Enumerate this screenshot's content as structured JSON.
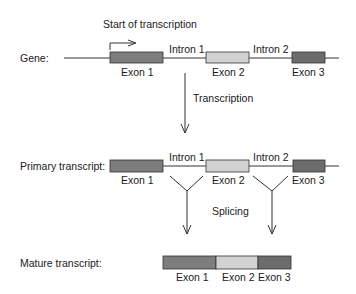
{
  "diagram": {
    "gene": {
      "row_label": "Gene:",
      "start_label": "Start of transcription",
      "exons": [
        "Exon 1",
        "Exon 2",
        "Exon 3"
      ],
      "introns": [
        "Intron 1",
        "Intron 2"
      ]
    },
    "step1_label": "Transcription",
    "primary": {
      "row_label": "Primary transcript:",
      "exons": [
        "Exon 1",
        "Exon 2",
        "Exon 3"
      ],
      "introns": [
        "Intron 1",
        "Intron 2"
      ]
    },
    "step2_label": "Splicing",
    "mature": {
      "row_label": "Mature transcript:",
      "exons": [
        "Exon 1",
        "Exon 2",
        "Exon 3"
      ]
    },
    "colors": {
      "exon1": "#7d7d7d",
      "exon2": "#d2d2d2",
      "exon3": "#6c6c6c",
      "line": "#333333"
    }
  }
}
